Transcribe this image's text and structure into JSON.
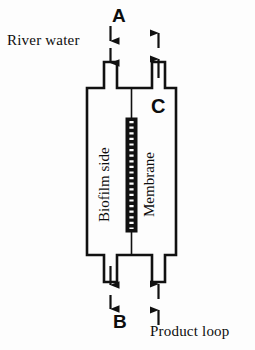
{
  "diagram": {
    "stroke_color": "#111111",
    "background_color": "#fdfdfd",
    "membrane_color": "#111111",
    "labels": {
      "river_water": "River water",
      "product_loop": "Product loop",
      "point_a": "A",
      "point_b": "B",
      "point_c": "C",
      "biofilm_side": "Biofilm side",
      "membrane": "Membrane"
    },
    "flows": [
      {
        "name": "river-water-inlet",
        "label": "A",
        "direction": "down",
        "position": "top-left",
        "arrow_count": 2
      },
      {
        "name": "top-right-outlet",
        "direction": "up",
        "position": "top-right",
        "arrow_count": 2
      },
      {
        "name": "bottom-left-outlet",
        "label": "B",
        "direction": "down",
        "position": "bottom-left",
        "arrow_count": 2
      },
      {
        "name": "product-loop-inlet",
        "label": "Product loop",
        "direction": "up",
        "position": "bottom-right",
        "arrow_count": 2
      }
    ],
    "compartments": [
      {
        "name": "biofilm-side",
        "label": "Biofilm side",
        "side": "left"
      },
      {
        "name": "membrane-side",
        "label": "Membrane",
        "side": "right"
      }
    ]
  }
}
